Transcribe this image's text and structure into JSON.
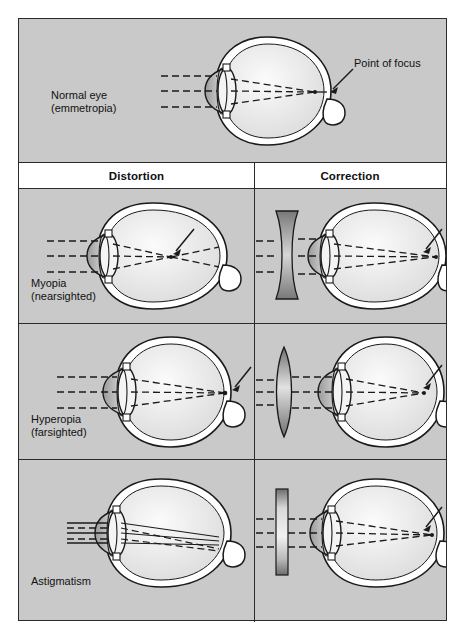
{
  "figure": {
    "background_color": "#c9c9c9",
    "border_color": "#2b2b2b"
  },
  "columns": {
    "distortion_label": "Distortion",
    "correction_label": "Correction"
  },
  "annotations": {
    "point_of_focus": "Point of focus"
  },
  "rows": [
    {
      "id": "normal",
      "label": "Normal eye\n(emmetropia)",
      "label_line1": "Normal eye",
      "label_line2": "(emmetropia)",
      "eye_shape": "spherical",
      "focus_location": "on retina",
      "ray_style": "dashed",
      "correction_lens": "none"
    },
    {
      "id": "myopia",
      "label": "Myopia\n(nearsighted)",
      "label_line1": "Myopia",
      "label_line2": "(nearsighted)",
      "eye_shape": "elongated",
      "focus_location": "in front of retina",
      "ray_style": "dashed",
      "correction_lens": "biconcave"
    },
    {
      "id": "hyperopia",
      "label": "Hyperopia\n(farsighted)",
      "label_line1": "Hyperopia",
      "label_line2": "(farsighted)",
      "eye_shape": "shortened",
      "focus_location": "behind retina",
      "ray_style": "dashed",
      "correction_lens": "biconvex"
    },
    {
      "id": "astigmatism",
      "label": "Astigmatism",
      "label_line1": "Astigmatism",
      "label_line2": "",
      "eye_shape": "irregular cornea",
      "focus_location": "multiple focal points",
      "ray_style": "solid and dashed",
      "correction_lens": "cylindrical"
    }
  ],
  "colors": {
    "panel_background": "#c9c9c9",
    "header_background": "#ffffff",
    "line": "#1a1a1a",
    "lens_fill": "#8c8c8c",
    "sclera_fill": "#ffffff",
    "vitreous_fill": "#ededed",
    "cornea_fill": "#a5a5a5",
    "text": "#111111"
  }
}
